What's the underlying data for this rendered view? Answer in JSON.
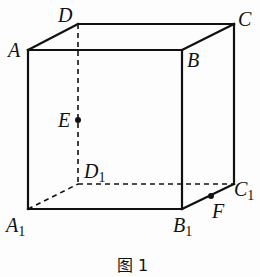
{
  "diagram": {
    "type": "cube",
    "caption": "图 1",
    "vertices": {
      "A": {
        "label": "A",
        "sub": "",
        "x": 28,
        "y": 50
      },
      "B": {
        "label": "B",
        "sub": "",
        "x": 182,
        "y": 50
      },
      "C": {
        "label": "C",
        "sub": "",
        "x": 234,
        "y": 24
      },
      "D": {
        "label": "D",
        "sub": "",
        "x": 78,
        "y": 24
      },
      "A1": {
        "label": "A",
        "sub": "1",
        "x": 28,
        "y": 209
      },
      "B1": {
        "label": "B",
        "sub": "1",
        "x": 182,
        "y": 209
      },
      "C1": {
        "label": "C",
        "sub": "1",
        "x": 234,
        "y": 184
      },
      "D1": {
        "label": "D",
        "sub": "1",
        "x": 78,
        "y": 184
      }
    },
    "points": {
      "E": {
        "label": "E",
        "on_edge": "DD1",
        "x": 78,
        "y": 120
      },
      "F": {
        "label": "F",
        "on_edge": "B1C1",
        "x": 211,
        "y": 196
      }
    },
    "solid_edges": [
      "AB",
      "BC",
      "CD",
      "DA",
      "AA1",
      "BB1",
      "CC1",
      "A1B1",
      "B1C1"
    ],
    "dashed_edges": [
      "DD1",
      "A1D1",
      "D1C1"
    ],
    "stroke_color": "#111111"
  }
}
